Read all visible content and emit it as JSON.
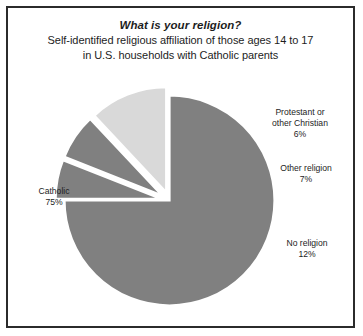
{
  "chart": {
    "title": "What is your religion?",
    "subtitle_line1": "Self-identified religious affiliation of those ages 14 to 17",
    "subtitle_line2": "in U.S. households with Catholic parents"
  },
  "labels": {
    "catholic": {
      "name": "Catholic",
      "pct": "75%"
    },
    "protestant": {
      "name_line1": "Protestant or",
      "name_line2": "other Christian",
      "pct": "6%"
    },
    "other_religion": {
      "name": "Other religion",
      "pct": "7%"
    },
    "no_religion": {
      "name": "No religion",
      "pct": "12%"
    }
  },
  "colors": {
    "catholic": "#808080",
    "protestant": "#808080",
    "other_religion": "#808080",
    "no_religion": "#d9d9d9",
    "separator": "#ffffff",
    "border": "#2b2b2b",
    "background": "#ffffff",
    "text": "#1d1d1d"
  },
  "chart_data": {
    "type": "pie",
    "title": "What is your religion?",
    "subtitle": "Self-identified religious affiliation of those ages 14 to 17 in U.S. households with Catholic parents",
    "categories": [
      "Catholic",
      "Protestant or other Christian",
      "Other religion",
      "No religion"
    ],
    "values": [
      75,
      6,
      7,
      12
    ],
    "value_labels": [
      "75%",
      "6%",
      "7%",
      "12%"
    ],
    "units": "percent",
    "colors": [
      "#808080",
      "#808080",
      "#808080",
      "#d9d9d9"
    ],
    "legend": "none",
    "labels_position": "outside",
    "exploded_slices": [
      "Protestant or other Christian",
      "Other religion",
      "No religion"
    ],
    "grid": false
  }
}
